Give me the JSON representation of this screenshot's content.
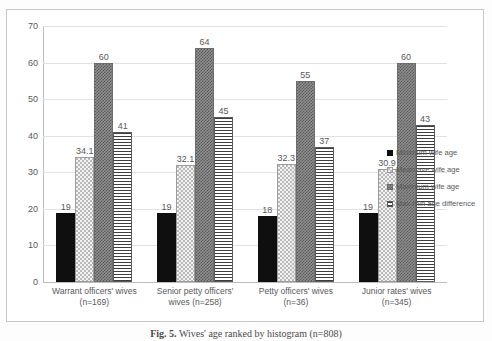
{
  "chart_data": {
    "type": "bar",
    "title": "",
    "xlabel": "",
    "ylabel": "",
    "ylim": [
      0,
      70
    ],
    "ytick_step": 10,
    "yticks": [
      0,
      10,
      20,
      30,
      40,
      50,
      60,
      70
    ],
    "grid": true,
    "legend_position": "right",
    "categories": [
      "Warrant officers' wives (n=169)",
      "Senior petty officers' wives (n=258)",
      "Petty officers' wives (n=36)",
      "Junior rates' wives (n=345)"
    ],
    "category_lines": [
      [
        "Warrant officers' wives",
        "(n=169)"
      ],
      [
        "Senior petty officers'",
        "wives (n=258)"
      ],
      [
        "Petty officers' wives",
        "(n=36)"
      ],
      [
        "Junior rates' wives",
        "(n=345)"
      ]
    ],
    "series": [
      {
        "name": "Minimum wife age",
        "pattern": "solid-black",
        "values": [
          19,
          19,
          18,
          19
        ],
        "labels": [
          "19",
          "19",
          "18",
          "19"
        ]
      },
      {
        "name": "Mean ave wife age",
        "pattern": "light-dotted",
        "values": [
          34.1,
          32.1,
          32.3,
          30.9
        ],
        "labels": [
          "34.1",
          "32.1",
          "32.3",
          "30.9"
        ]
      },
      {
        "name": "Maximum wife age",
        "pattern": "dark-checkered",
        "values": [
          60,
          64,
          55,
          60
        ],
        "labels": [
          "60",
          "64",
          "55",
          "60"
        ]
      },
      {
        "name": "Max-min age difference",
        "pattern": "horizontal-stripes",
        "values": [
          41,
          45,
          37,
          43
        ],
        "labels": [
          "41",
          "45",
          "37",
          "43"
        ]
      }
    ]
  },
  "legend": {
    "items": [
      "Minimum wife age",
      "Mean ave wife age",
      "Maximum wife age",
      "Max-min age difference"
    ]
  },
  "caption": {
    "prefix": "Fig. 5.",
    "text": "Wives' age ranked by histogram (n=808)"
  },
  "colors": {
    "minimum": "#0f0f0f",
    "mean": "#f2f2f2",
    "maximum": "#8e8e8e",
    "difference": "#ffffff",
    "gridline": "#e2e2e2",
    "axis": "#bdbdbd",
    "text": "#58595b"
  }
}
